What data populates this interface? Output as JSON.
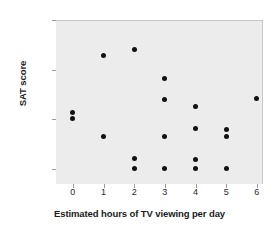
{
  "chart_data": {
    "type": "scatter",
    "title": "",
    "xlabel": "Estimated hours of TV viewing per day",
    "ylabel": "SAT score",
    "xlim": [
      -0.55,
      6.2
    ],
    "ylim": [
      370,
      700
    ],
    "grid": false,
    "legend": null,
    "xticks": [
      "0",
      "1",
      "2",
      "3",
      "4",
      "5",
      "6"
    ],
    "xtick_values": [
      0,
      1,
      2,
      3,
      4,
      5,
      6
    ],
    "yticks": [
      "400",
      "500",
      "600",
      "700"
    ],
    "ytick_values": [
      400,
      500,
      600,
      700
    ],
    "marker": {
      "shape": "circle",
      "color": "#111111",
      "size": 5
    },
    "plot_background": "#ececed",
    "points": [
      {
        "x": 0,
        "y": 515
      },
      {
        "x": 0,
        "y": 503
      },
      {
        "x": 1,
        "y": 630
      },
      {
        "x": 1,
        "y": 467
      },
      {
        "x": 2,
        "y": 643
      },
      {
        "x": 2,
        "y": 423
      },
      {
        "x": 2,
        "y": 404
      },
      {
        "x": 3,
        "y": 585
      },
      {
        "x": 3,
        "y": 542
      },
      {
        "x": 3,
        "y": 467
      },
      {
        "x": 3,
        "y": 404
      },
      {
        "x": 4,
        "y": 528
      },
      {
        "x": 4,
        "y": 483
      },
      {
        "x": 4,
        "y": 422
      },
      {
        "x": 4,
        "y": 404
      },
      {
        "x": 5,
        "y": 482
      },
      {
        "x": 5,
        "y": 467
      },
      {
        "x": 5,
        "y": 404
      },
      {
        "x": 6,
        "y": 545
      }
    ]
  }
}
